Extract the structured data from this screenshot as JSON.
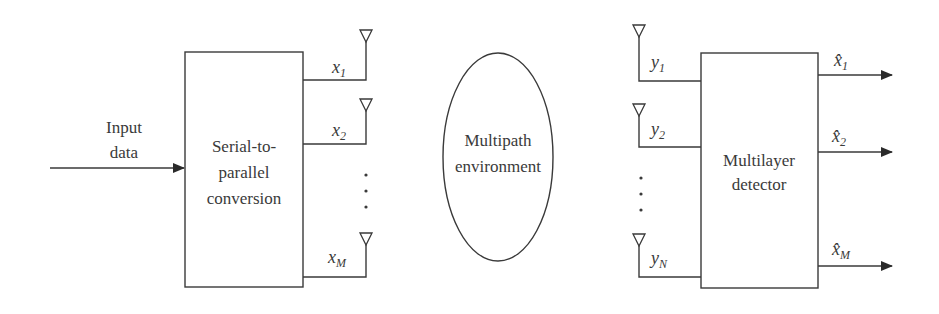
{
  "diagram": {
    "type": "MIMO system block diagram",
    "input": {
      "label_line1": "Input",
      "label_line2": "data"
    },
    "transmitter_block": {
      "line1": "Serial-to-",
      "line2": "parallel",
      "line3": "conversion"
    },
    "tx_outputs": [
      {
        "var": "x",
        "sub": "1"
      },
      {
        "var": "x",
        "sub": "2"
      },
      {
        "var": "x",
        "sub": "M"
      }
    ],
    "channel": {
      "line1": "Multipath",
      "line2": "environment"
    },
    "rx_inputs": [
      {
        "var": "y",
        "sub": "1"
      },
      {
        "var": "y",
        "sub": "2"
      },
      {
        "var": "y",
        "sub": "N"
      }
    ],
    "receiver_block": {
      "line1": "Multilayer",
      "line2": "detector"
    },
    "rx_outputs": [
      {
        "var": "x̂",
        "sub": "1"
      },
      {
        "var": "x̂",
        "sub": "2"
      },
      {
        "var": "x̂",
        "sub": "M"
      }
    ],
    "ellipsis": "⋮",
    "colors": {
      "line": "#3a3a3a",
      "background": "#ffffff"
    }
  }
}
